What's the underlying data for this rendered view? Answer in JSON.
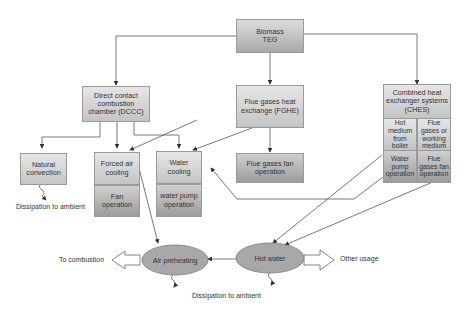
{
  "diagram": {
    "root": {
      "label": "Biomass TEG"
    },
    "level1": {
      "dccc": {
        "label": "Direct contact combustion chamber (DCCC)"
      },
      "fghe": {
        "label": "Flue gases heat exchange (FGHE)"
      },
      "ches": {
        "label": "Combined heat exchanger systems (CHES)"
      }
    },
    "ches_cells": {
      "hot_medium": "Hot medium from boiler",
      "flue_gases_medium": "Flue gases or working medium",
      "water_pump": "Water pump operation",
      "flue_fan": "Flue gases fan operation"
    },
    "level2": {
      "natural_convection": "Natural convection",
      "forced_air_cooling": "Forced air cooling",
      "fan_operation": "Fan operation",
      "water_cooling": "Water cooling",
      "water_pump_operation": "water pump operation",
      "flue_gases_fan_operation": "Flue gases fan operation"
    },
    "outputs": {
      "air_preheating": "Air preheating",
      "hot_water": "Hot water"
    },
    "annotations": {
      "dissipation_1": "Dissipation to ambient",
      "dissipation_2": "Dissipation to ambient",
      "to_combustion": "To combustion",
      "other_usage": "Other usage"
    },
    "colors": {
      "box_light": "#e6e6e6",
      "box_dark": "#a9a9a9",
      "ellipse_fill": "#a8a8a8",
      "line": "#555555"
    }
  }
}
